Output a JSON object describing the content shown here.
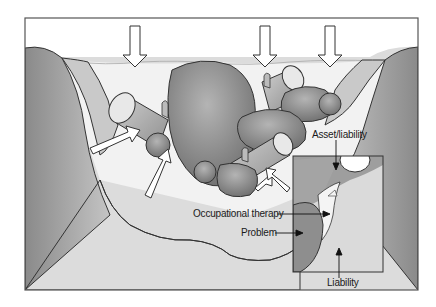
{
  "figure": {
    "colors": {
      "frame": "#555555",
      "riverbank": "#9a9a9a",
      "riverbed": "#dedede",
      "water": "#f2f2f2",
      "rock": "#8c8c8c",
      "log": "#b8b8b8",
      "arrow_fill": "#ffffff",
      "text": "#1a1a1a"
    },
    "water_flow_arrows": 3,
    "pressure_arrows": 4,
    "labels": {
      "asset_liability": "Asset/liability",
      "occupational_therapy": "Occupational therapy",
      "problem": "Problem",
      "liability": "Liability"
    }
  }
}
